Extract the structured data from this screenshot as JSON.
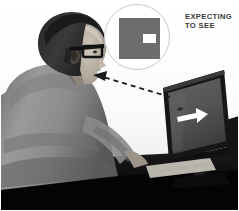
{
  "figure": {
    "kind": "photo-illustration",
    "width": 239,
    "height": 211,
    "background_color": "#ffffff",
    "border_color": "#ffffff"
  },
  "scene": {
    "description": "Grayscale photograph of a seated balding man in profile wearing dark-rimmed glasses, viewed from behind his left shoulder, working at a flat-panel computer monitor on a dark desk with a keyboard.",
    "person": {
      "label": "seated-man",
      "jacket_color": "#8d8d8d",
      "hair_color": "#2b2b2b",
      "skin_color": "#b9b2a8",
      "glasses_color": "#1c1c1c"
    },
    "monitor": {
      "label": "computer-monitor",
      "bezel_color": "#1a1a1a",
      "screen_color": "#565656",
      "desk_color": "#0b0b0b"
    }
  },
  "screen_content": {
    "symbol": "right-arrow",
    "symbol_color": "#ffffff",
    "description": "A white arrow pointing to the right is displayed on the monitor screen."
  },
  "callout": {
    "label": "expectation-inset",
    "circle_border_color": "#c9c9c9",
    "square_color": "#6d6d6d",
    "patch_color": "#ffffff",
    "description": "Circular inset showing a gray square containing a small white rectangle positioned right of center.",
    "caption_line_1": "EXPECTING",
    "caption_line_2": "TO SEE",
    "caption_color": "#3a3a3a"
  },
  "gaze_line": {
    "label": "gaze-arrow",
    "style": "dashed",
    "color": "#1b1b1b",
    "direction": "from-monitor-to-eye",
    "arrowhead": "left"
  }
}
